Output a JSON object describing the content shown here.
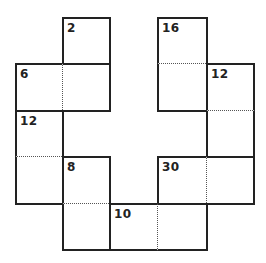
{
  "puzzle": {
    "type": "killer-cage-grid",
    "grid": {
      "origin_x": 16,
      "origin_y": 18,
      "col_lines": [
        16,
        63,
        110,
        158,
        207,
        254
      ],
      "row_lines": [
        18,
        64,
        111,
        157,
        204,
        250
      ],
      "line_color": "#222222",
      "dotted_color": "#555555"
    },
    "cells": [
      {
        "r": 0,
        "c": 1,
        "cage": "A"
      },
      {
        "r": 0,
        "c": 3,
        "cage": "B"
      },
      {
        "r": 1,
        "c": 3,
        "cage": "B"
      },
      {
        "r": 1,
        "c": 0,
        "cage": "C"
      },
      {
        "r": 1,
        "c": 1,
        "cage": "C"
      },
      {
        "r": 1,
        "c": 4,
        "cage": "D"
      },
      {
        "r": 2,
        "c": 4,
        "cage": "D"
      },
      {
        "r": 2,
        "c": 0,
        "cage": "E"
      },
      {
        "r": 3,
        "c": 0,
        "cage": "E"
      },
      {
        "r": 3,
        "c": 1,
        "cage": "F"
      },
      {
        "r": 4,
        "c": 1,
        "cage": "F"
      },
      {
        "r": 3,
        "c": 3,
        "cage": "G"
      },
      {
        "r": 3,
        "c": 4,
        "cage": "G"
      },
      {
        "r": 4,
        "c": 2,
        "cage": "H"
      },
      {
        "r": 4,
        "c": 3,
        "cage": "H"
      }
    ],
    "cages": [
      {
        "id": "A",
        "clue": "2",
        "clue_cell": {
          "r": 0,
          "c": 1
        }
      },
      {
        "id": "B",
        "clue": "16",
        "clue_cell": {
          "r": 0,
          "c": 3
        }
      },
      {
        "id": "C",
        "clue": "6",
        "clue_cell": {
          "r": 1,
          "c": 0
        }
      },
      {
        "id": "D",
        "clue": "12",
        "clue_cell": {
          "r": 1,
          "c": 4
        }
      },
      {
        "id": "E",
        "clue": "12",
        "clue_cell": {
          "r": 2,
          "c": 0
        }
      },
      {
        "id": "F",
        "clue": "8",
        "clue_cell": {
          "r": 3,
          "c": 1
        }
      },
      {
        "id": "G",
        "clue": "30",
        "clue_cell": {
          "r": 3,
          "c": 3
        }
      },
      {
        "id": "H",
        "clue": "10",
        "clue_cell": {
          "r": 4,
          "c": 2
        }
      }
    ]
  }
}
